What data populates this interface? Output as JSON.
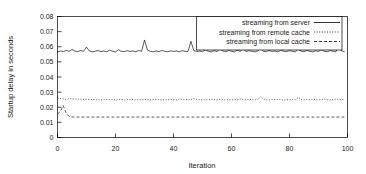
{
  "chart_data": {
    "type": "line",
    "title": "",
    "xlabel": "Iteration",
    "ylabel": "Startup delay in seconds",
    "xlim": [
      0,
      100
    ],
    "ylim": [
      0,
      0.08
    ],
    "xticks": [
      "0",
      "20",
      "40",
      "60",
      "80",
      "100"
    ],
    "xtick_values": [
      0,
      20,
      40,
      60,
      80,
      100
    ],
    "yticks": [
      "0",
      "0.01",
      "0.02",
      "0.03",
      "0.04",
      "0.05",
      "0.06",
      "0.07",
      "0.08"
    ],
    "ytick_values": [
      0,
      0.01,
      0.02,
      0.03,
      0.04,
      0.05,
      0.06,
      0.07,
      0.08
    ],
    "grid": false,
    "legend_position": "top-right",
    "x": [
      0,
      1,
      2,
      3,
      4,
      5,
      6,
      7,
      8,
      9,
      10,
      11,
      12,
      13,
      14,
      15,
      16,
      17,
      18,
      19,
      20,
      21,
      22,
      23,
      24,
      25,
      26,
      27,
      28,
      29,
      30,
      31,
      32,
      33,
      34,
      35,
      36,
      37,
      38,
      39,
      40,
      41,
      42,
      43,
      44,
      45,
      46,
      47,
      48,
      49,
      50,
      51,
      52,
      53,
      54,
      55,
      56,
      57,
      58,
      59,
      60,
      61,
      62,
      63,
      64,
      65,
      66,
      67,
      68,
      69,
      70,
      71,
      72,
      73,
      74,
      75,
      76,
      77,
      78,
      79,
      80,
      81,
      82,
      83,
      84,
      85,
      86,
      87,
      88,
      89,
      90,
      91,
      92,
      93,
      94,
      95,
      96,
      97,
      98,
      99
    ],
    "series": [
      {
        "name": "streaming from server",
        "style": "solid",
        "color": "#000000",
        "values": [
          0.0565,
          0.0572,
          0.0568,
          0.0575,
          0.057,
          0.0582,
          0.0572,
          0.0568,
          0.0575,
          0.057,
          0.0598,
          0.0572,
          0.0566,
          0.057,
          0.0575,
          0.0568,
          0.0572,
          0.0567,
          0.0578,
          0.057,
          0.0566,
          0.058,
          0.057,
          0.0568,
          0.0574,
          0.0569,
          0.0572,
          0.0567,
          0.0575,
          0.057,
          0.0645,
          0.0578,
          0.057,
          0.0566,
          0.0572,
          0.0568,
          0.0575,
          0.057,
          0.0567,
          0.0573,
          0.0569,
          0.0572,
          0.0567,
          0.0574,
          0.057,
          0.0568,
          0.0636,
          0.0575,
          0.0568,
          0.0572,
          0.0567,
          0.058,
          0.057,
          0.0566,
          0.0574,
          0.0568,
          0.0585,
          0.0572,
          0.0567,
          0.0575,
          0.057,
          0.0566,
          0.0578,
          0.057,
          0.0586,
          0.0568,
          0.0574,
          0.057,
          0.0566,
          0.0572,
          0.0588,
          0.057,
          0.0567,
          0.0575,
          0.0569,
          0.0572,
          0.0566,
          0.0578,
          0.057,
          0.0568,
          0.0574,
          0.057,
          0.0566,
          0.0584,
          0.0571,
          0.0567,
          0.0575,
          0.057,
          0.0566,
          0.0573,
          0.0569,
          0.058,
          0.057,
          0.0567,
          0.0575,
          0.057,
          0.0566,
          0.0605,
          0.0572,
          0.0568
        ]
      },
      {
        "name": "streaming from remote cache",
        "style": "dotted",
        "color": "#000000",
        "values": [
          0.0262,
          0.0258,
          0.0255,
          0.0252,
          0.0258,
          0.0254,
          0.0256,
          0.0252,
          0.0254,
          0.0251,
          0.0253,
          0.025,
          0.0252,
          0.0249,
          0.0251,
          0.0248,
          0.025,
          0.0252,
          0.0249,
          0.0251,
          0.0248,
          0.025,
          0.0252,
          0.0249,
          0.0251,
          0.0253,
          0.025,
          0.0248,
          0.0251,
          0.0249,
          0.0252,
          0.025,
          0.0248,
          0.0251,
          0.0253,
          0.025,
          0.0248,
          0.0251,
          0.0249,
          0.0252,
          0.025,
          0.0248,
          0.0255,
          0.0251,
          0.0249,
          0.0252,
          0.025,
          0.0258,
          0.0252,
          0.0249,
          0.0251,
          0.0248,
          0.025,
          0.0253,
          0.0251,
          0.0249,
          0.0252,
          0.025,
          0.0248,
          0.0251,
          0.0249,
          0.0252,
          0.025,
          0.0255,
          0.0251,
          0.0249,
          0.0252,
          0.025,
          0.0248,
          0.0251,
          0.0268,
          0.0253,
          0.025,
          0.0248,
          0.0251,
          0.0249,
          0.0252,
          0.025,
          0.0248,
          0.0251,
          0.0249,
          0.0252,
          0.025,
          0.0265,
          0.0252,
          0.0249,
          0.0251,
          0.0249,
          0.0252,
          0.025,
          0.0248,
          0.0251,
          0.0253,
          0.025,
          0.0248,
          0.0251,
          0.0255,
          0.0252,
          0.025,
          0.0253
        ]
      },
      {
        "name": "streaming from local cache",
        "style": "dashed",
        "color": "#000000",
        "values": [
          0.0155,
          0.0172,
          0.021,
          0.016,
          0.014,
          0.0136,
          0.0135,
          0.0135,
          0.0135,
          0.0135,
          0.0135,
          0.0135,
          0.0135,
          0.0135,
          0.0135,
          0.0135,
          0.0135,
          0.0135,
          0.0135,
          0.0135,
          0.0135,
          0.0135,
          0.0135,
          0.0135,
          0.0135,
          0.0135,
          0.0135,
          0.0135,
          0.0135,
          0.0135,
          0.0135,
          0.0135,
          0.0135,
          0.0135,
          0.0135,
          0.0135,
          0.0135,
          0.0135,
          0.0135,
          0.0135,
          0.0135,
          0.0135,
          0.0135,
          0.0135,
          0.0135,
          0.0135,
          0.0135,
          0.0135,
          0.0135,
          0.0135,
          0.0135,
          0.0135,
          0.0135,
          0.0135,
          0.0135,
          0.0135,
          0.0135,
          0.0135,
          0.0135,
          0.0135,
          0.0135,
          0.0135,
          0.0135,
          0.0135,
          0.0135,
          0.0135,
          0.0135,
          0.0135,
          0.0135,
          0.0135,
          0.0135,
          0.0135,
          0.0135,
          0.0135,
          0.0135,
          0.0135,
          0.0135,
          0.0135,
          0.0135,
          0.0135,
          0.0135,
          0.0135,
          0.0135,
          0.0135,
          0.0135,
          0.0135,
          0.0135,
          0.0135,
          0.0135,
          0.0135,
          0.0135,
          0.0135,
          0.0135,
          0.0135,
          0.0135,
          0.0135,
          0.0135,
          0.0135,
          0.0135,
          0.0135
        ]
      }
    ]
  }
}
